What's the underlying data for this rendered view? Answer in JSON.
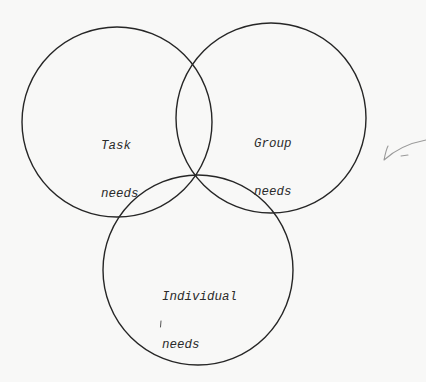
{
  "diagram": {
    "type": "venn",
    "sets": [
      {
        "id": "task",
        "line1": "Task",
        "line2": "needs"
      },
      {
        "id": "group",
        "line1": "Group",
        "line2": "needs"
      },
      {
        "id": "individual",
        "line1": "Individual",
        "line2": "needs"
      }
    ],
    "colors": {
      "outline": "#262626",
      "text": "#2b2b2b",
      "background": "#f8f8f7",
      "pencil_mark": "#9a9a9a"
    }
  },
  "annotations": {
    "margin_mark": "check-mark",
    "stray_mark": "pencil-tick"
  }
}
